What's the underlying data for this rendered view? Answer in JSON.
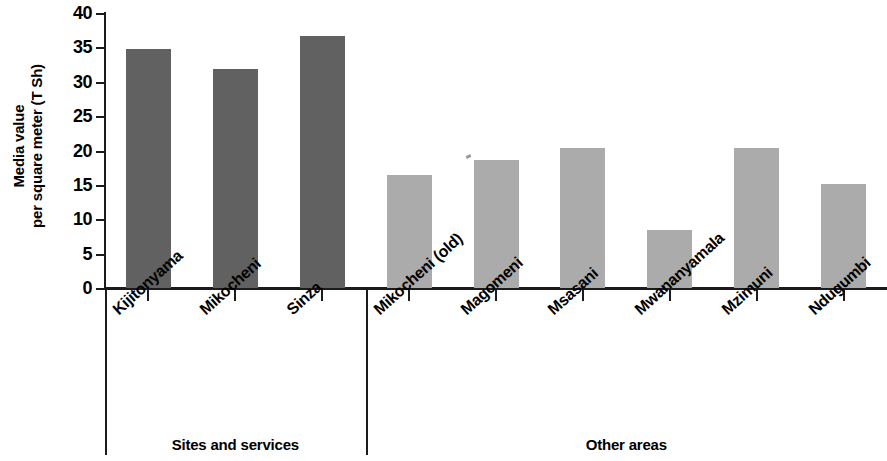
{
  "chart_data": {
    "type": "bar",
    "title": "",
    "xlabel": "",
    "ylabel_line1": "Media value",
    "ylabel_line2": "per square meter (T Sh)",
    "ylabel": "Media value per square meter (T Sh)",
    "ylim": [
      0,
      40
    ],
    "yticks": [
      0,
      5,
      10,
      15,
      20,
      25,
      30,
      35,
      40
    ],
    "ytick_labels": [
      "0",
      "5",
      "10",
      "15",
      "20",
      "25",
      "30",
      "35",
      "40"
    ],
    "grid": false,
    "legend": "none",
    "categories": [
      "Kijitonyama",
      "Mikocheni",
      "Sinza",
      "Mikocheni (old)",
      "Magomeni",
      "Msasani",
      "Mwananyamala",
      "Mzimuni",
      "Ndugumbi"
    ],
    "values": [
      34.7,
      31.9,
      36.6,
      16.4,
      18.6,
      20.4,
      8.4,
      20.3,
      15.1
    ],
    "bar_colors": [
      "#616161",
      "#616161",
      "#616161",
      "#ababab",
      "#ababab",
      "#ababab",
      "#ababab",
      "#ababab",
      "#ababab"
    ],
    "groups": [
      {
        "label": "Sites and services",
        "categories": [
          "Kijitonyama",
          "Mikocheni",
          "Sinza"
        ],
        "color": "#616161"
      },
      {
        "label": "Other areas",
        "categories": [
          "Mikocheni (old)",
          "Magomeni",
          "Msasani",
          "Mwananyamala",
          "Mzimuni",
          "Ndugumbi"
        ],
        "color": "#ababab"
      }
    ],
    "colors": {
      "dark_bar": "#616161",
      "light_bar": "#ababab",
      "axis": "#1b1b1b",
      "background": "#ffffff"
    }
  }
}
